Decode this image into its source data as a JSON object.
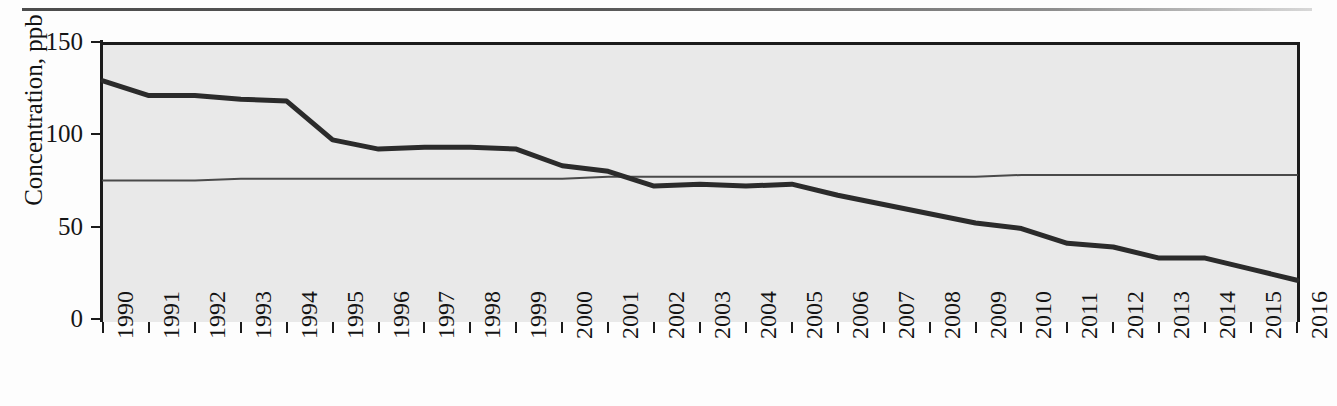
{
  "chart_data": {
    "type": "line",
    "title": "",
    "xlabel": "",
    "ylabel": "Concentration, ppb",
    "xlim": [
      1990,
      2016
    ],
    "ylim": [
      0,
      150
    ],
    "yticks": [
      0,
      50,
      100,
      150
    ],
    "ytick_labels": [
      "0",
      "50",
      "100",
      "150"
    ],
    "grid": false,
    "legend": "none",
    "categories": [
      "1990",
      "1991",
      "1992",
      "1993",
      "1994",
      "1995",
      "1996",
      "1997",
      "1998",
      "1999",
      "2000",
      "2001",
      "2002",
      "2003",
      "2004",
      "2005",
      "2006",
      "2007",
      "2008",
      "2009",
      "2010",
      "2011",
      "2012",
      "2013",
      "2014",
      "2015",
      "2016"
    ],
    "x": [
      1990,
      1991,
      1992,
      1993,
      1994,
      1995,
      1996,
      1997,
      1998,
      1999,
      2000,
      2001,
      2002,
      2003,
      2004,
      2005,
      2006,
      2007,
      2008,
      2009,
      2010,
      2011,
      2012,
      2013,
      2014,
      2015,
      2016
    ],
    "series": [
      {
        "name": "Concentration",
        "style": "thick-line",
        "color": "#2b2b2b",
        "values": [
          129,
          121,
          121,
          119,
          118,
          97,
          92,
          93,
          93,
          92,
          83,
          80,
          72,
          73,
          72,
          73,
          67,
          62,
          57,
          52,
          49,
          41,
          39,
          33,
          33,
          27,
          21
        ]
      },
      {
        "name": "Reference level",
        "style": "thin-line",
        "color": "#4a4a4a",
        "values": [
          75,
          75,
          75,
          76,
          76,
          76,
          76,
          76,
          76,
          76,
          76,
          77,
          77,
          77,
          77,
          77,
          77,
          77,
          77,
          77,
          78,
          78,
          78,
          78,
          78,
          78,
          78
        ]
      }
    ],
    "annotations": []
  },
  "axes": {
    "y_ticks": [
      "150",
      "100",
      "50",
      "0"
    ],
    "x_ticks": [
      "1990",
      "1991",
      "1992",
      "1993",
      "1994",
      "1995",
      "1996",
      "1997",
      "1998",
      "1999",
      "2000",
      "2001",
      "2002",
      "2003",
      "2004",
      "2005",
      "2006",
      "2007",
      "2008",
      "2009",
      "2010",
      "2011",
      "2012",
      "2013",
      "2014",
      "2015",
      "2016"
    ],
    "y_axis_title": "Concentration, ppb"
  },
  "colors": {
    "plot_background": "#e9e9e9",
    "axis": "#1b1b1b",
    "series_main": "#2b2b2b",
    "series_reference": "#4a4a4a",
    "page_background": "#fdfdfd"
  }
}
